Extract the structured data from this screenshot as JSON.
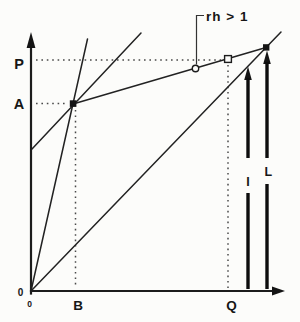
{
  "figure": {
    "kind": "economics-growth-diagram",
    "background": "#fcfcfa",
    "ink_color": "#1c1c1c",
    "dotted_color": "#4a4a4a",
    "labels": {
      "p": "P",
      "a": "A",
      "zero_left": "0",
      "zero_below": "0",
      "b": "B",
      "q": "Q",
      "annotation": "rh > 1",
      "arrow_i": "I",
      "arrow_l": "L"
    },
    "elements": [
      "y-axis with up arrow",
      "x-axis with right arrow",
      "45-degree ray from origin",
      "steep ray from origin",
      "medium ray from y-axis intercept",
      "shallow line labeled rh > 1",
      "dotted horizontal guide at P",
      "dotted horizontal guide at A",
      "dotted vertical guide at B",
      "dotted vertical guide at Q",
      "filled square marker at A intersection",
      "open circle marker on rh line",
      "open square marker above Q",
      "filled marker at top-right intersection",
      "bold vertical arrow I with label gap",
      "bold vertical arrow L with label gap"
    ]
  }
}
